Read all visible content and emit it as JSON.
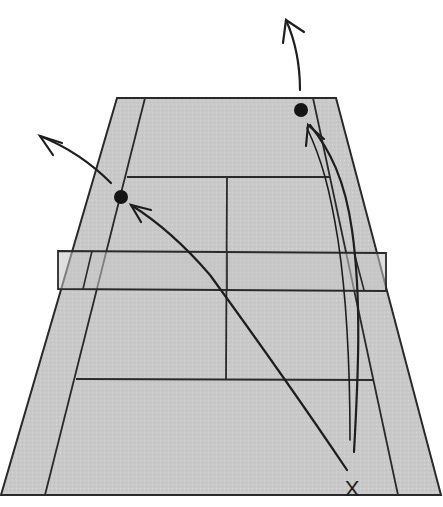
{
  "diagram": {
    "type": "tennis-court-shot-diagram",
    "view": "perspective from behind baseline",
    "colors": {
      "background": "#ffffff",
      "court_fill": "#c9c9c9",
      "line": "#2a2a2a",
      "ball": "#151515"
    },
    "court": {
      "far_baseline": {
        "x1": 117,
        "x2": 336,
        "y": 98
      },
      "near_baseline": {
        "x1": 1,
        "x2": 441,
        "y": 495
      },
      "far_singles": {
        "left_x": 145,
        "right_x": 313
      },
      "near_singles": {
        "left_x": 45,
        "right_x": 398
      },
      "far_service_line": {
        "x1": 127,
        "x2": 330,
        "y": 177
      },
      "near_service_line": {
        "x1": 76,
        "x2": 373,
        "y": 379
      },
      "center_line": {
        "x_top": 227,
        "x_bottom": 226
      },
      "net": {
        "x1": 58,
        "x2": 386,
        "y_top": 251,
        "y_bottom": 290
      }
    },
    "player_marker": {
      "label": "X",
      "x": 352,
      "y": 487
    },
    "balls": [
      {
        "name": "ball-left-landing",
        "x": 121,
        "y": 197,
        "r": 7
      },
      {
        "name": "ball-right-landing",
        "x": 301,
        "y": 110,
        "r": 7
      }
    ],
    "shots": [
      {
        "name": "shot-crosscourt",
        "from": "player",
        "to": "ball-left-landing"
      },
      {
        "name": "shot-down-the-line",
        "from": "player",
        "to": "ball-right-landing"
      }
    ],
    "bounce_arrows": [
      {
        "name": "bounce-arrow-left",
        "from": "ball-left-landing",
        "direction": "up-left"
      },
      {
        "name": "bounce-arrow-right",
        "from": "ball-right-landing",
        "direction": "up"
      }
    ]
  }
}
